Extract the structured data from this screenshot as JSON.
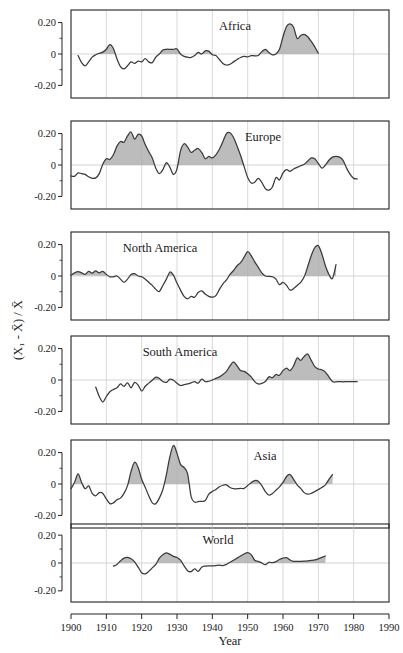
{
  "chart_data": {
    "type": "line",
    "title": "",
    "xlabel": "Year",
    "ylabel": "(X₁ - X̄) / X̄",
    "xlim": [
      1900,
      1990
    ],
    "ylim": [
      -0.28,
      0.28
    ],
    "grid": true,
    "legend_position": "none",
    "xticks": [
      1900,
      1910,
      1920,
      1930,
      1940,
      1950,
      1960,
      1970,
      1980,
      1990
    ],
    "xticklabels": [
      "1900",
      "1910",
      "1920",
      "1930",
      "1940",
      "1950",
      "1960",
      "1970",
      "1980",
      "1990"
    ],
    "yticks": [
      0.2,
      0,
      -0.2
    ],
    "yticklabels": [
      "0.20",
      "0",
      "-0.20"
    ],
    "yminorticks": [
      0.1,
      -0.1
    ],
    "fill_rule": "shaded gray where value > 0",
    "panels": [
      {
        "name": "Africa",
        "label": "Africa",
        "x": [
          1902,
          1903,
          1904,
          1905,
          1906,
          1907,
          1908,
          1909,
          1910,
          1911,
          1912,
          1913,
          1914,
          1915,
          1916,
          1917,
          1918,
          1919,
          1920,
          1921,
          1922,
          1923,
          1924,
          1925,
          1926,
          1927,
          1928,
          1929,
          1930,
          1931,
          1932,
          1933,
          1934,
          1935,
          1936,
          1937,
          1938,
          1939,
          1940,
          1941,
          1942,
          1943,
          1944,
          1945,
          1946,
          1947,
          1948,
          1949,
          1950,
          1951,
          1952,
          1953,
          1954,
          1955,
          1956,
          1957,
          1958,
          1959,
          1960,
          1961,
          1962,
          1963,
          1964,
          1965,
          1966,
          1967,
          1968,
          1969,
          1970,
          1971,
          1972
        ],
        "y": [
          -0.01,
          -0.055,
          -0.075,
          -0.05,
          -0.02,
          -0.005,
          0.005,
          0.012,
          0.03,
          0.06,
          0.035,
          -0.03,
          -0.08,
          -0.095,
          -0.075,
          -0.05,
          -0.06,
          -0.045,
          -0.05,
          -0.03,
          -0.05,
          -0.055,
          -0.02,
          0.0,
          0.025,
          0.03,
          0.03,
          0.03,
          0.032,
          0.0,
          -0.015,
          -0.02,
          -0.022,
          -0.01,
          0.01,
          0.0,
          0.02,
          0.018,
          -0.005,
          -0.01,
          -0.035,
          -0.06,
          -0.07,
          -0.065,
          -0.05,
          -0.035,
          -0.022,
          -0.015,
          -0.018,
          -0.01,
          -0.012,
          -0.01,
          0.015,
          0.03,
          0.01,
          -0.005,
          0.0,
          0.03,
          0.11,
          0.175,
          0.192,
          0.17,
          0.1,
          0.118,
          0.125,
          0.11,
          0.08,
          0.045,
          0.005,
          -0.025
        ]
      },
      {
        "name": "Europe",
        "label": "Europe",
        "x": [
          1900,
          1901,
          1902,
          1903,
          1904,
          1905,
          1906,
          1907,
          1908,
          1909,
          1910,
          1911,
          1912,
          1913,
          1914,
          1915,
          1916,
          1917,
          1918,
          1919,
          1920,
          1921,
          1922,
          1923,
          1924,
          1925,
          1926,
          1927,
          1928,
          1929,
          1930,
          1931,
          1932,
          1933,
          1934,
          1935,
          1936,
          1937,
          1938,
          1939,
          1940,
          1941,
          1942,
          1943,
          1944,
          1945,
          1946,
          1947,
          1948,
          1949,
          1950,
          1951,
          1952,
          1953,
          1954,
          1955,
          1956,
          1957,
          1958,
          1959,
          1960,
          1961,
          1962,
          1963,
          1964,
          1965,
          1966,
          1967,
          1968,
          1969,
          1970,
          1971,
          1972,
          1973,
          1974,
          1975,
          1976,
          1977,
          1978,
          1979,
          1980,
          1981
        ],
        "y": [
          -0.07,
          -0.072,
          -0.05,
          -0.055,
          -0.06,
          -0.075,
          -0.085,
          -0.082,
          -0.055,
          0.005,
          0.04,
          0.035,
          0.065,
          0.12,
          0.15,
          0.145,
          0.185,
          0.21,
          0.165,
          0.195,
          0.185,
          0.13,
          0.085,
          0.045,
          -0.02,
          -0.055,
          -0.03,
          0.015,
          -0.015,
          -0.06,
          -0.025,
          0.09,
          0.135,
          0.115,
          0.08,
          0.095,
          0.105,
          0.08,
          0.04,
          0.055,
          0.045,
          0.065,
          0.1,
          0.15,
          0.2,
          0.205,
          0.175,
          0.12,
          0.06,
          -0.01,
          -0.08,
          -0.115,
          -0.11,
          -0.085,
          -0.11,
          -0.15,
          -0.16,
          -0.14,
          -0.08,
          -0.095,
          -0.05,
          -0.03,
          -0.04,
          -0.025,
          -0.015,
          -0.005,
          0.005,
          0.025,
          0.045,
          0.04,
          0.01,
          -0.02,
          0.0,
          0.03,
          0.05,
          0.055,
          0.05,
          0.03,
          -0.02,
          -0.06,
          -0.085,
          -0.088
        ]
      },
      {
        "name": "North America",
        "label": "North America",
        "x": [
          1900,
          1901,
          1902,
          1903,
          1904,
          1905,
          1906,
          1907,
          1908,
          1909,
          1910,
          1911,
          1912,
          1913,
          1914,
          1915,
          1916,
          1917,
          1918,
          1919,
          1920,
          1921,
          1922,
          1923,
          1924,
          1925,
          1926,
          1927,
          1928,
          1929,
          1930,
          1931,
          1932,
          1933,
          1934,
          1935,
          1936,
          1937,
          1938,
          1939,
          1940,
          1941,
          1942,
          1943,
          1944,
          1945,
          1946,
          1947,
          1948,
          1949,
          1950,
          1951,
          1952,
          1953,
          1954,
          1955,
          1956,
          1957,
          1958,
          1959,
          1960,
          1961,
          1962,
          1963,
          1964,
          1965,
          1966,
          1967,
          1968,
          1969,
          1970,
          1971,
          1972,
          1973,
          1974,
          1975
        ],
        "y": [
          0.005,
          0.02,
          0.028,
          0.02,
          0.01,
          0.03,
          0.018,
          0.032,
          0.02,
          0.03,
          0.01,
          -0.005,
          -0.005,
          0.0,
          -0.02,
          -0.04,
          -0.02,
          0.01,
          0.015,
          0.0,
          -0.005,
          -0.02,
          -0.04,
          -0.06,
          -0.085,
          -0.098,
          -0.06,
          -0.02,
          0.025,
          0.005,
          -0.045,
          -0.09,
          -0.13,
          -0.145,
          -0.13,
          -0.135,
          -0.105,
          -0.095,
          -0.115,
          -0.13,
          -0.135,
          -0.125,
          -0.085,
          -0.05,
          -0.025,
          0.01,
          0.035,
          0.065,
          0.085,
          0.12,
          0.155,
          0.13,
          0.09,
          0.055,
          0.02,
          0.0,
          -0.002,
          -0.005,
          -0.02,
          -0.055,
          -0.04,
          -0.06,
          -0.09,
          -0.08,
          -0.06,
          -0.04,
          -0.005,
          0.06,
          0.13,
          0.18,
          0.192,
          0.14,
          0.065,
          0.01,
          -0.015,
          0.072
        ]
      },
      {
        "name": "South America",
        "label": "South America",
        "x": [
          1907,
          1908,
          1909,
          1910,
          1911,
          1912,
          1913,
          1914,
          1915,
          1916,
          1917,
          1918,
          1919,
          1920,
          1921,
          1922,
          1923,
          1924,
          1925,
          1926,
          1927,
          1928,
          1929,
          1930,
          1931,
          1932,
          1933,
          1934,
          1935,
          1936,
          1937,
          1938,
          1939,
          1940,
          1941,
          1942,
          1943,
          1944,
          1945,
          1946,
          1947,
          1948,
          1949,
          1950,
          1951,
          1952,
          1953,
          1954,
          1955,
          1956,
          1957,
          1958,
          1959,
          1960,
          1961,
          1962,
          1963,
          1964,
          1965,
          1966,
          1967,
          1968,
          1969,
          1970,
          1971,
          1972,
          1973,
          1974,
          1975,
          1976,
          1977,
          1978,
          1979,
          1980,
          1981
        ],
        "y": [
          -0.045,
          -0.105,
          -0.14,
          -0.105,
          -0.075,
          -0.06,
          -0.05,
          -0.025,
          -0.04,
          -0.018,
          -0.05,
          -0.015,
          -0.032,
          -0.07,
          -0.04,
          -0.02,
          -0.002,
          0.018,
          0.01,
          -0.01,
          -0.015,
          0.005,
          -0.002,
          -0.02,
          -0.035,
          -0.03,
          -0.025,
          -0.018,
          -0.01,
          -0.02,
          0.005,
          -0.01,
          -0.008,
          0.0,
          0.01,
          0.02,
          0.035,
          0.055,
          0.09,
          0.115,
          0.09,
          0.06,
          0.055,
          0.04,
          0.02,
          -0.01,
          -0.025,
          -0.022,
          -0.01,
          0.02,
          0.015,
          0.035,
          0.03,
          0.06,
          0.075,
          0.06,
          0.09,
          0.14,
          0.125,
          0.15,
          0.165,
          0.125,
          0.085,
          0.07,
          0.065,
          0.05,
          0.02,
          -0.01,
          -0.012,
          -0.01,
          -0.012,
          -0.01,
          -0.01,
          -0.01,
          -0.01
        ]
      },
      {
        "name": "Asia",
        "label": "Asia",
        "x": [
          1900,
          1901,
          1902,
          1903,
          1904,
          1905,
          1906,
          1907,
          1908,
          1909,
          1910,
          1911,
          1912,
          1913,
          1914,
          1915,
          1916,
          1917,
          1918,
          1919,
          1920,
          1921,
          1922,
          1923,
          1924,
          1925,
          1926,
          1927,
          1928,
          1929,
          1930,
          1931,
          1932,
          1933,
          1934,
          1935,
          1936,
          1937,
          1938,
          1939,
          1940,
          1941,
          1942,
          1943,
          1944,
          1945,
          1946,
          1947,
          1948,
          1949,
          1950,
          1951,
          1952,
          1953,
          1954,
          1955,
          1956,
          1957,
          1958,
          1959,
          1960,
          1961,
          1962,
          1963,
          1964,
          1965,
          1966,
          1967,
          1968,
          1969,
          1970,
          1971,
          1972,
          1973,
          1974
        ],
        "y": [
          -0.03,
          0.01,
          0.065,
          0.01,
          -0.03,
          -0.012,
          -0.06,
          -0.075,
          -0.055,
          -0.06,
          -0.095,
          -0.125,
          -0.12,
          -0.1,
          -0.09,
          -0.06,
          -0.01,
          0.08,
          0.138,
          0.105,
          0.03,
          -0.02,
          -0.075,
          -0.12,
          -0.125,
          -0.09,
          -0.035,
          0.06,
          0.175,
          0.245,
          0.195,
          0.125,
          0.105,
          0.065,
          -0.08,
          -0.115,
          -0.112,
          -0.11,
          -0.105,
          -0.065,
          -0.048,
          -0.035,
          -0.018,
          -0.008,
          -0.005,
          -0.022,
          -0.03,
          -0.03,
          -0.028,
          -0.028,
          -0.01,
          0.008,
          0.022,
          0.018,
          -0.01,
          -0.048,
          -0.07,
          -0.06,
          -0.04,
          -0.018,
          0.01,
          0.048,
          0.06,
          0.03,
          -0.005,
          -0.028,
          -0.055,
          -0.065,
          -0.06,
          -0.048,
          -0.035,
          -0.022,
          -0.005,
          0.03,
          0.06
        ]
      },
      {
        "name": "World",
        "label": "World",
        "x": [
          1912,
          1913,
          1914,
          1915,
          1916,
          1917,
          1918,
          1919,
          1920,
          1921,
          1922,
          1923,
          1924,
          1925,
          1926,
          1927,
          1928,
          1929,
          1930,
          1931,
          1932,
          1933,
          1934,
          1935,
          1936,
          1937,
          1938,
          1939,
          1940,
          1941,
          1942,
          1943,
          1944,
          1945,
          1946,
          1947,
          1948,
          1949,
          1950,
          1951,
          1952,
          1953,
          1954,
          1955,
          1956,
          1957,
          1958,
          1959,
          1960,
          1961,
          1962,
          1963,
          1964,
          1965,
          1966,
          1967,
          1968,
          1969,
          1970,
          1971,
          1972
        ],
        "y": [
          -0.022,
          -0.01,
          0.015,
          0.035,
          0.04,
          0.03,
          0.008,
          -0.03,
          -0.07,
          -0.078,
          -0.06,
          -0.035,
          -0.01,
          0.035,
          0.06,
          0.072,
          0.062,
          0.048,
          0.04,
          0.02,
          -0.02,
          -0.055,
          -0.062,
          -0.042,
          -0.06,
          -0.03,
          -0.022,
          -0.02,
          -0.02,
          -0.018,
          -0.015,
          -0.018,
          -0.01,
          0.005,
          0.02,
          0.035,
          0.05,
          0.065,
          0.075,
          0.06,
          0.02,
          0.012,
          0.0,
          -0.012,
          0.005,
          0.002,
          0.01,
          0.025,
          0.035,
          0.038,
          0.022,
          0.012,
          0.012,
          0.012,
          0.013,
          0.015,
          0.018,
          0.022,
          0.03,
          0.04,
          0.05
        ]
      }
    ]
  },
  "colors": {
    "fill": "#b0b0b0",
    "line": "#3a3a3a",
    "grid": "#c8c8c8",
    "frame": "#222222",
    "background": "#ffffff"
  }
}
